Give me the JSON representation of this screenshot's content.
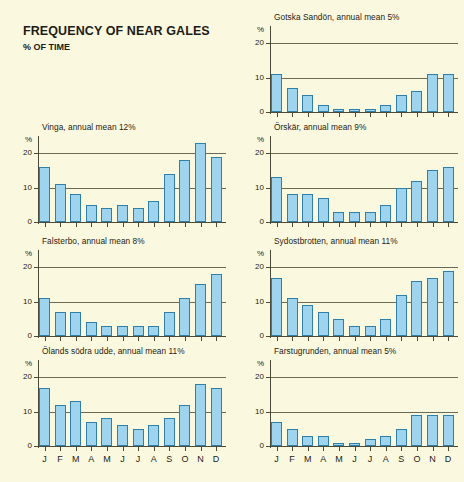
{
  "heading": {
    "title": "FREQUENCY OF NEAR GALES",
    "subtitle": "% OF TIME"
  },
  "axis": {
    "pct_symbol": "%",
    "y_ticks": [
      "0",
      "10",
      "20"
    ],
    "months": [
      "J",
      "F",
      "M",
      "A",
      "M",
      "J",
      "J",
      "A",
      "S",
      "O",
      "N",
      "D"
    ]
  },
  "colors": {
    "background": "#fbf8e0",
    "bar_fill": "#9fd4ee",
    "bar_stroke": "#2f7fa8",
    "axis": "#4a4a38",
    "grid": "#6b6b55",
    "text": "#1c1c14"
  },
  "chart_data": [
    {
      "type": "bar",
      "title": "Gotska Sandön, annual mean 5%",
      "station": "Gotska Sandön",
      "annual_mean": 5,
      "xlabel": "",
      "ylabel": "%",
      "ylim": [
        0,
        25
      ],
      "yticks": [
        0,
        10,
        20
      ],
      "grid": true,
      "categories": [
        "J",
        "F",
        "M",
        "A",
        "M",
        "J",
        "J",
        "A",
        "S",
        "O",
        "N",
        "D"
      ],
      "values": [
        11,
        7,
        5,
        2,
        1,
        1,
        1,
        2,
        5,
        6,
        11,
        11
      ]
    },
    {
      "type": "bar",
      "title": "Vinga, annual mean 12%",
      "station": "Vinga",
      "annual_mean": 12,
      "xlabel": "",
      "ylabel": "%",
      "ylim": [
        0,
        25
      ],
      "yticks": [
        0,
        10,
        20
      ],
      "grid": true,
      "categories": [
        "J",
        "F",
        "M",
        "A",
        "M",
        "J",
        "J",
        "A",
        "S",
        "O",
        "N",
        "D"
      ],
      "values": [
        16,
        11,
        8,
        5,
        4,
        5,
        4,
        6,
        14,
        18,
        23,
        19
      ]
    },
    {
      "type": "bar",
      "title": "Örskär, annual mean 9%",
      "station": "Örskär",
      "annual_mean": 9,
      "xlabel": "",
      "ylabel": "%",
      "ylim": [
        0,
        25
      ],
      "yticks": [
        0,
        10,
        20
      ],
      "grid": true,
      "categories": [
        "J",
        "F",
        "M",
        "A",
        "M",
        "J",
        "J",
        "A",
        "S",
        "O",
        "N",
        "D"
      ],
      "values": [
        13,
        8,
        8,
        7,
        3,
        3,
        3,
        5,
        10,
        12,
        15,
        16
      ]
    },
    {
      "type": "bar",
      "title": "Falsterbo, annual mean 8%",
      "station": "Falsterbo",
      "annual_mean": 8,
      "xlabel": "",
      "ylabel": "%",
      "ylim": [
        0,
        25
      ],
      "yticks": [
        0,
        10,
        20
      ],
      "grid": true,
      "categories": [
        "J",
        "F",
        "M",
        "A",
        "M",
        "J",
        "J",
        "A",
        "S",
        "O",
        "N",
        "D"
      ],
      "values": [
        11,
        7,
        7,
        4,
        3,
        3,
        3,
        3,
        7,
        11,
        15,
        18
      ]
    },
    {
      "type": "bar",
      "title": "Sydostbrotten, annual mean 11%",
      "station": "Sydostbrotten",
      "annual_mean": 11,
      "xlabel": "",
      "ylabel": "%",
      "ylim": [
        0,
        25
      ],
      "yticks": [
        0,
        10,
        20
      ],
      "grid": true,
      "categories": [
        "J",
        "F",
        "M",
        "A",
        "M",
        "J",
        "J",
        "A",
        "S",
        "O",
        "N",
        "D"
      ],
      "values": [
        17,
        11,
        9,
        7,
        5,
        3,
        3,
        5,
        12,
        16,
        17,
        19
      ]
    },
    {
      "type": "bar",
      "title": "Ölands södra udde, annual mean 11%",
      "station": "Ölands södra udde",
      "annual_mean": 11,
      "xlabel": "",
      "ylabel": "%",
      "ylim": [
        0,
        25
      ],
      "yticks": [
        0,
        10,
        20
      ],
      "grid": true,
      "categories": [
        "J",
        "F",
        "M",
        "A",
        "M",
        "J",
        "J",
        "A",
        "S",
        "O",
        "N",
        "D"
      ],
      "values": [
        17,
        12,
        13,
        7,
        8,
        6,
        5,
        6,
        8,
        12,
        18,
        17
      ]
    },
    {
      "type": "bar",
      "title": "Farstugrunden, annual mean 5%",
      "station": "Farstugrunden",
      "annual_mean": 5,
      "xlabel": "",
      "ylabel": "%",
      "ylim": [
        0,
        25
      ],
      "yticks": [
        0,
        10,
        20
      ],
      "grid": true,
      "categories": [
        "J",
        "F",
        "M",
        "A",
        "M",
        "J",
        "J",
        "A",
        "S",
        "O",
        "N",
        "D"
      ],
      "values": [
        7,
        5,
        3,
        3,
        1,
        1,
        2,
        3,
        5,
        9,
        9,
        9
      ]
    }
  ],
  "panel_layout": [
    {
      "chart_index": 0,
      "class": "p0",
      "show_months": false
    },
    {
      "chart_index": 1,
      "class": "p1",
      "show_months": false
    },
    {
      "chart_index": 2,
      "class": "p2",
      "show_months": false
    },
    {
      "chart_index": 3,
      "class": "p3",
      "show_months": false
    },
    {
      "chart_index": 4,
      "class": "p4",
      "show_months": false
    },
    {
      "chart_index": 5,
      "class": "p5",
      "show_months": true
    },
    {
      "chart_index": 6,
      "class": "p6",
      "show_months": true
    }
  ]
}
